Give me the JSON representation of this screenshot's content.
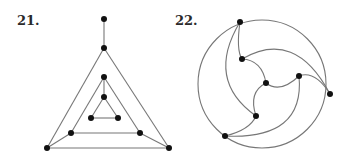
{
  "figures": [
    {
      "label": "21.",
      "type": "graph",
      "nodes": [
        {
          "id": "t0",
          "x": 104,
          "y": 19
        },
        {
          "id": "t1",
          "x": 104,
          "y": 48
        },
        {
          "id": "m0",
          "x": 104,
          "y": 77
        },
        {
          "id": "i0",
          "x": 104,
          "y": 97
        },
        {
          "id": "i1",
          "x": 91,
          "y": 118
        },
        {
          "id": "i2",
          "x": 118,
          "y": 118
        },
        {
          "id": "m1",
          "x": 71,
          "y": 133
        },
        {
          "id": "m2",
          "x": 140,
          "y": 133
        },
        {
          "id": "o1",
          "x": 47,
          "y": 148
        },
        {
          "id": "o2",
          "x": 169,
          "y": 148
        }
      ],
      "edges": [
        [
          "t0",
          "t1"
        ],
        [
          "t1",
          "o1"
        ],
        [
          "t1",
          "o2"
        ],
        [
          "o1",
          "o2"
        ],
        [
          "m0",
          "m1"
        ],
        [
          "m0",
          "m2"
        ],
        [
          "m1",
          "m2"
        ],
        [
          "m0",
          "i0"
        ],
        [
          "i0",
          "i1"
        ],
        [
          "i0",
          "i2"
        ],
        [
          "i1",
          "i2"
        ],
        [
          "m1",
          "o1"
        ],
        [
          "m2",
          "o2"
        ]
      ]
    },
    {
      "label": "22.",
      "type": "graph",
      "circle": {
        "cx": 262,
        "cy": 84,
        "r": 64
      },
      "nodes": [
        {
          "id": "A",
          "x": 240,
          "y": 22
        },
        {
          "id": "B",
          "x": 242,
          "y": 59
        },
        {
          "id": "C",
          "x": 266,
          "y": 83
        },
        {
          "id": "D",
          "x": 299,
          "y": 76
        },
        {
          "id": "E",
          "x": 330,
          "y": 94
        },
        {
          "id": "F",
          "x": 256,
          "y": 116
        },
        {
          "id": "G",
          "x": 225,
          "y": 136
        }
      ]
    }
  ]
}
